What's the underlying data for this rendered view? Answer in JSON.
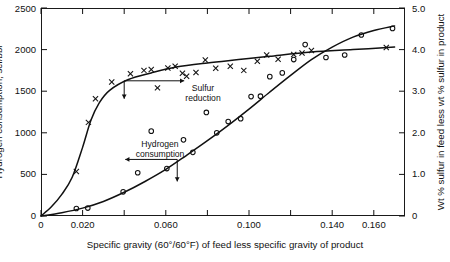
{
  "chart_data": {
    "type": "scatter",
    "title": "",
    "xlabel": "Specific gravity (60°/60°F) of feed less specific gravity of product",
    "ylabel": "Hydrogen consumption, scf/bbl",
    "y2label": "Wt % sulfur in feed less wt % sulfur in product",
    "xlim": [
      0,
      0.175
    ],
    "ylim": [
      0,
      2500
    ],
    "y2lim": [
      0,
      5.0
    ],
    "grid": false,
    "legend": "none",
    "x_ticks": [
      0,
      0.02,
      0.04,
      0.06,
      0.08,
      0.1,
      0.12,
      0.14,
      0.16
    ],
    "x_tick_labels": [
      "0",
      "0.020",
      "",
      "0.060",
      "",
      "0.100",
      "",
      "0.140",
      "0.160"
    ],
    "y_ticks": [
      0,
      500,
      1000,
      1500,
      2000,
      2500
    ],
    "y_tick_labels": [
      "0",
      "500",
      "1000",
      "1500",
      "2000",
      "2500"
    ],
    "y2_ticks": [
      0,
      1.0,
      2.0,
      3.0,
      4.0,
      5.0
    ],
    "y2_tick_labels": [
      "0",
      "1.0",
      "2.0",
      "3.0",
      "4.0",
      "5.0"
    ],
    "series": [
      {
        "name": "Sulfur reduction",
        "marker": "x",
        "axis": "right",
        "points": [
          [
            0.017,
            1.07
          ],
          [
            0.0228,
            2.25
          ],
          [
            0.0262,
            2.82
          ],
          [
            0.034,
            3.22
          ],
          [
            0.043,
            3.42
          ],
          [
            0.0495,
            3.5
          ],
          [
            0.053,
            3.52
          ],
          [
            0.056,
            3.08
          ],
          [
            0.061,
            3.56
          ],
          [
            0.0645,
            3.6
          ],
          [
            0.068,
            3.43
          ],
          [
            0.07,
            3.36
          ],
          [
            0.0745,
            3.45
          ],
          [
            0.079,
            3.75
          ],
          [
            0.084,
            3.55
          ],
          [
            0.091,
            3.6
          ],
          [
            0.0975,
            3.5
          ],
          [
            0.104,
            3.72
          ],
          [
            0.1085,
            3.87
          ],
          [
            0.114,
            3.77
          ],
          [
            0.1215,
            3.88
          ],
          [
            0.1255,
            3.92
          ],
          [
            0.13,
            3.98
          ],
          [
            0.166,
            4.05
          ]
        ]
      },
      {
        "name": "Hydrogen consumption",
        "marker": "o",
        "axis": "left",
        "points": [
          [
            0.017,
            90
          ],
          [
            0.0225,
            95
          ],
          [
            0.0395,
            290
          ],
          [
            0.0465,
            520
          ],
          [
            0.053,
            1020
          ],
          [
            0.0605,
            570
          ],
          [
            0.0685,
            915
          ],
          [
            0.073,
            765
          ],
          [
            0.0795,
            1245
          ],
          [
            0.0845,
            1000
          ],
          [
            0.09,
            1135
          ],
          [
            0.096,
            1170
          ],
          [
            0.101,
            1435
          ],
          [
            0.1055,
            1440
          ],
          [
            0.11,
            1675
          ],
          [
            0.116,
            1720
          ],
          [
            0.1215,
            1880
          ],
          [
            0.127,
            2060
          ],
          [
            0.137,
            1905
          ],
          [
            0.146,
            1935
          ],
          [
            0.154,
            2175
          ],
          [
            0.169,
            2255
          ]
        ]
      }
    ],
    "curves": [
      {
        "name": "sulfur-reduction-curve",
        "axis": "right",
        "points": [
          [
            0.0,
            0.0
          ],
          [
            0.005,
            0.22
          ],
          [
            0.01,
            0.52
          ],
          [
            0.015,
            0.93
          ],
          [
            0.02,
            1.65
          ],
          [
            0.024,
            2.3
          ],
          [
            0.028,
            2.72
          ],
          [
            0.033,
            3.02
          ],
          [
            0.042,
            3.28
          ],
          [
            0.053,
            3.44
          ],
          [
            0.065,
            3.58
          ],
          [
            0.08,
            3.68
          ],
          [
            0.095,
            3.76
          ],
          [
            0.11,
            3.84
          ],
          [
            0.13,
            3.94
          ],
          [
            0.15,
            4.0
          ],
          [
            0.17,
            4.06
          ]
        ]
      },
      {
        "name": "hydrogen-consumption-curve",
        "axis": "left",
        "points": [
          [
            0.0,
            0
          ],
          [
            0.01,
            40
          ],
          [
            0.02,
            95
          ],
          [
            0.03,
            175
          ],
          [
            0.04,
            285
          ],
          [
            0.05,
            415
          ],
          [
            0.06,
            560
          ],
          [
            0.07,
            730
          ],
          [
            0.08,
            905
          ],
          [
            0.09,
            1090
          ],
          [
            0.1,
            1285
          ],
          [
            0.11,
            1490
          ],
          [
            0.12,
            1690
          ],
          [
            0.13,
            1880
          ],
          [
            0.14,
            2030
          ],
          [
            0.15,
            2150
          ],
          [
            0.16,
            2230
          ],
          [
            0.17,
            2285
          ]
        ]
      }
    ],
    "annotations": [
      {
        "name": "sulfur-reduction",
        "text_line1": "Sulfur",
        "text_line2": "reduction",
        "arrow_direction": "right",
        "pointer_direction": "down"
      },
      {
        "name": "hydrogen-consumption",
        "text_line1": "Hydrogen",
        "text_line2": "consumption",
        "arrow_direction": "left",
        "pointer_direction": "down"
      }
    ],
    "caption": ""
  },
  "axes": {
    "left_title": "Hydrogen consumption, scf/bbl",
    "right_title": "Wt % sulfur in feed less wt % sulfur in product",
    "bottom_title": "Specific gravity (60°/60°F) of feed less specific gravity of product"
  },
  "annotations": {
    "sulfur_l1": "Sulfur",
    "sulfur_l2": "reduction",
    "hydrogen_l1": "Hydrogen",
    "hydrogen_l2": "consumption"
  },
  "ticks": {
    "y_left": [
      "2500",
      "2000",
      "1500",
      "1000",
      "500",
      "0"
    ],
    "y_right": [
      "5.0",
      "4.0",
      "3.0",
      "2.0",
      "1.0",
      "0"
    ],
    "x": [
      "0",
      "0.020",
      "0.060",
      "0.100",
      "0.140",
      "0.160"
    ]
  },
  "colors": {
    "ink": "#111111",
    "background": "#ffffff"
  }
}
